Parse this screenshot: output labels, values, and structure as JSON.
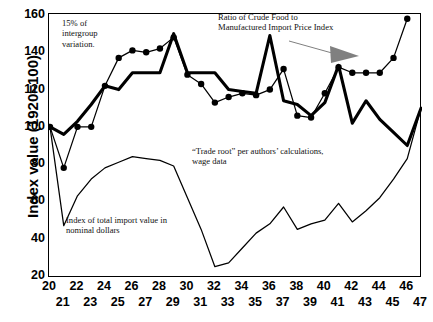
{
  "chart_data": {
    "type": "line",
    "title": "",
    "xlabel": "",
    "ylabel": "Index value (1920=100)",
    "ylim": [
      20,
      160
    ],
    "yticks": [
      20,
      40,
      60,
      80,
      100,
      120,
      140,
      160
    ],
    "xlim": [
      20,
      47
    ],
    "xticks": [
      20,
      21,
      22,
      23,
      24,
      25,
      26,
      27,
      28,
      29,
      30,
      31,
      32,
      33,
      34,
      35,
      36,
      37,
      38,
      39,
      40,
      41,
      42,
      43,
      44,
      45,
      46,
      47
    ],
    "xticklabels": [
      "20",
      "21",
      "22",
      "23",
      "24",
      "25",
      "26",
      "27",
      "28",
      "29",
      "30",
      "31",
      "32",
      "33",
      "34",
      "35",
      "36",
      "37",
      "38",
      "39",
      "40",
      "41",
      "42",
      "43",
      "44",
      "45",
      "46",
      "47"
    ],
    "grid": false,
    "legend": "none (in-plot annotations)",
    "x": [
      20,
      21,
      22,
      23,
      24,
      25,
      26,
      27,
      28,
      29,
      30,
      31,
      32,
      33,
      34,
      35,
      36,
      37,
      38,
      39,
      40,
      41,
      42,
      43,
      44,
      45,
      46,
      47
    ],
    "series": [
      {
        "name": "Ratio of Crude Food to Manufactured Import Price Index",
        "style": "thin-line-with-round-markers",
        "color": "#000000",
        "markers": true,
        "values": [
          100,
          78,
          100,
          100,
          122,
          137,
          141,
          140,
          142,
          148,
          128,
          123,
          113,
          116,
          118,
          117,
          120,
          131,
          106,
          105,
          118,
          132,
          129,
          129,
          129,
          137,
          158,
          null
        ]
      },
      {
        "name": "\"Trade root\" per authors' calculations, wage data",
        "style": "thick-line",
        "color": "#000000",
        "markers": false,
        "values": [
          100,
          96,
          103,
          112,
          122,
          120,
          129,
          129,
          129,
          150,
          129,
          129,
          129,
          120,
          119,
          118,
          149,
          114,
          112,
          106,
          113,
          133,
          102,
          114,
          104,
          97,
          90,
          110
        ]
      },
      {
        "name": "Index of total import value in nominal dollars",
        "style": "thin-line",
        "color": "#000000",
        "markers": false,
        "values": [
          100,
          47,
          63,
          72,
          78,
          81,
          84,
          83,
          82,
          79,
          62,
          45,
          25,
          27,
          35,
          43,
          48,
          57,
          45,
          48,
          50,
          59,
          49,
          55,
          62,
          72,
          83,
          110
        ]
      }
    ],
    "annotations": [
      {
        "id": "intergroup",
        "text": "15% of\nintergroup\nvariation."
      },
      {
        "id": "ratio",
        "text": "Ratio of Crude Food to\nManufactured Import Price Index"
      },
      {
        "id": "traderoot",
        "text": "“Trade root” per authors’ calculations,\nwage data"
      },
      {
        "id": "import",
        "text": "Index of total import value in\nnominal dollars"
      }
    ],
    "arrow": {
      "color": "#808080",
      "direction": "right-down"
    }
  }
}
